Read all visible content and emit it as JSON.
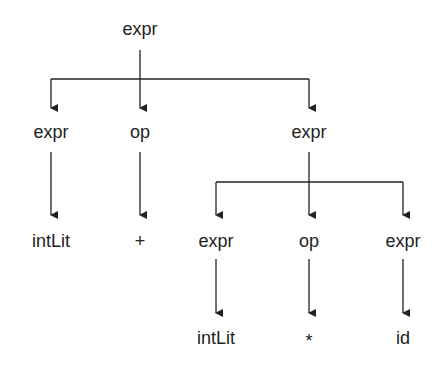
{
  "nodes": [
    {
      "id": "root",
      "label": "expr",
      "x": 140,
      "y": 29
    },
    {
      "id": "l2-expr",
      "label": "expr",
      "x": 51,
      "y": 132
    },
    {
      "id": "l2-op",
      "label": "op",
      "x": 140,
      "y": 132
    },
    {
      "id": "l2-expr-right",
      "label": "expr",
      "x": 309,
      "y": 132
    },
    {
      "id": "l3-intlit",
      "label": "intLit",
      "x": 51,
      "y": 241
    },
    {
      "id": "l3-plus",
      "label": "+",
      "x": 140,
      "y": 241
    },
    {
      "id": "l3-expr-a",
      "label": "expr",
      "x": 216,
      "y": 241
    },
    {
      "id": "l3-op",
      "label": "op",
      "x": 309,
      "y": 241
    },
    {
      "id": "l3-expr-b",
      "label": "expr",
      "x": 403,
      "y": 241
    },
    {
      "id": "l4-intlit",
      "label": "intLit",
      "x": 216,
      "y": 338
    },
    {
      "id": "l4-star",
      "label": "*",
      "x": 309,
      "y": 338
    },
    {
      "id": "l4-id",
      "label": "id",
      "x": 403,
      "y": 338
    }
  ],
  "edges": [
    {
      "from": "root",
      "to": "l2-expr"
    },
    {
      "from": "root",
      "to": "l2-op"
    },
    {
      "from": "root",
      "to": "l2-expr-right"
    },
    {
      "from": "l2-expr",
      "to": "l3-intlit"
    },
    {
      "from": "l2-op",
      "to": "l3-plus"
    },
    {
      "from": "l2-expr-right",
      "to": "l3-expr-a"
    },
    {
      "from": "l2-expr-right",
      "to": "l3-op"
    },
    {
      "from": "l2-expr-right",
      "to": "l3-expr-b"
    },
    {
      "from": "l3-expr-a",
      "to": "l4-intlit"
    },
    {
      "from": "l3-op",
      "to": "l4-star"
    },
    {
      "from": "l3-expr-b",
      "to": "l4-id"
    }
  ],
  "colors": {
    "line": "#222222",
    "text": "#222222",
    "background": "#ffffff"
  }
}
